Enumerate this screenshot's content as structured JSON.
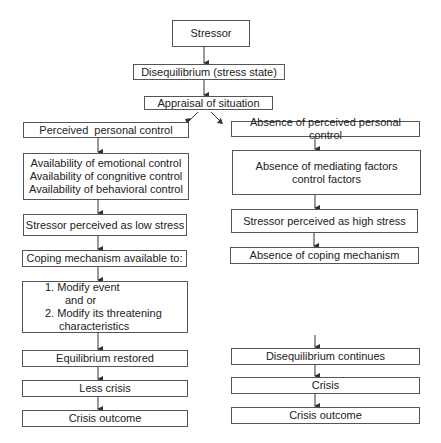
{
  "diagram": {
    "type": "flowchart",
    "top": {
      "stressor": "Stressor",
      "disequilibrium": "Disequilibrium (stress state)",
      "appraisal": "Appraisal of situation"
    },
    "left_branch": {
      "perceived_control": "Perceived  personal control",
      "availability": [
        "Availability of emotional control",
        "Availability of congnitive control",
        "Availability of behavioral control"
      ],
      "low_stress": "Stressor perceived as low stress",
      "coping": "Coping mechanism available to:",
      "modify": [
        "1. Modify event",
        "and or",
        "2. Modify its threatening",
        "characteristics"
      ],
      "equilibrium": "Equilibrium restored",
      "less_crisis": "Less crisis",
      "outcome": "Crisis outcome"
    },
    "right_branch": {
      "absence_control": "Absence of perceived personal control",
      "absence_mediating": [
        "Absence of mediating factors",
        "control factors"
      ],
      "high_stress": "Stressor perceived as high stress",
      "absence_coping": "Absence of coping mechanism",
      "diseq_continues": "Disequilibrium continues",
      "crisis": "Crisis",
      "outcome": "Crisis outcome"
    }
  }
}
